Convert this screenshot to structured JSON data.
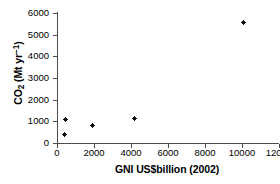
{
  "chart_data": {
    "type": "scatter",
    "title": "",
    "xlabel": "GNI US$billion (2002)",
    "ylabel": "CO2 (Mt yr-1)",
    "ylabel_parts": {
      "lead": "CO",
      "sub": "2",
      "mid": " (Mt yr",
      "sup": "−1",
      "tail": ")"
    },
    "xlim": [
      0,
      12000
    ],
    "ylim": [
      0,
      6000
    ],
    "xticks": [
      0,
      2000,
      4000,
      6000,
      8000,
      10000,
      12000
    ],
    "yticks": [
      0,
      1000,
      2000,
      3000,
      4000,
      5000,
      6000
    ],
    "xticklabels": [
      "0",
      "2000",
      "4000",
      "6000",
      "8000",
      "10000",
      "12000"
    ],
    "yticklabels": [
      "0",
      "1000",
      "2000",
      "3000",
      "4000",
      "5000",
      "6000"
    ],
    "grid": false,
    "legend": false,
    "marker_color": "#111111",
    "axis_color": "#4d4d4d",
    "background": "#ffffff",
    "points": [
      {
        "x": 400,
        "y": 370
      },
      {
        "x": 450,
        "y": 1080
      },
      {
        "x": 1900,
        "y": 790
      },
      {
        "x": 4200,
        "y": 1150
      },
      {
        "x": 10100,
        "y": 5550
      }
    ]
  }
}
